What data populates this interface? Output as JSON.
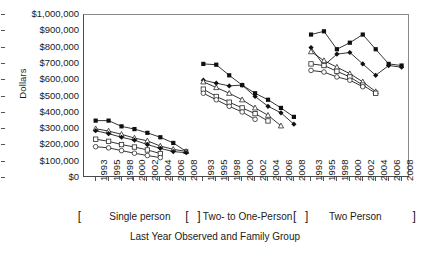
{
  "chart_data": {
    "type": "line",
    "title": "",
    "xlabel": "Last Year Observed and Family Group",
    "ylabel": "Dollars",
    "ylim": [
      0,
      1000000
    ],
    "ytick_labels": [
      "$1,000,000",
      "$900,000",
      "$800,000",
      "$700,000",
      "$600,000",
      "$500,000",
      "$400,000",
      "$300,000",
      "$200,000",
      "$100,000",
      "$0"
    ],
    "ytick_values": [
      1000000,
      900000,
      800000,
      700000,
      600000,
      500000,
      400000,
      300000,
      200000,
      100000,
      0
    ],
    "grid": false,
    "legend": "none",
    "categories": [
      "1993",
      "1995",
      "1998",
      "2000",
      "2002",
      "2004",
      "2006",
      "2008"
    ],
    "groups": [
      {
        "name": "Single person",
        "bracket_open": "[",
        "bracket_close": "]",
        "x": [
          "1993",
          "1995",
          "1998",
          "2000",
          "2002",
          "2004",
          "2006",
          "2008"
        ],
        "series": [
          {
            "name": "series-1",
            "marker": "filled-square",
            "values": [
              352000,
              352000,
              317000,
              300000,
              277000,
              250000,
              215000,
              163000
            ]
          },
          {
            "name": "series-2",
            "marker": "open-triangle",
            "values": [
              302000,
              288000,
              268000,
              245000,
              228000,
              196000,
              176000,
              163000
            ]
          },
          {
            "name": "series-3",
            "marker": "filled-diamond",
            "values": [
              290000,
              272000,
              250000,
              232000,
              205000,
              182000,
              162000,
              155000
            ]
          },
          {
            "name": "series-4",
            "marker": "open-square",
            "values": [
              238000,
              225000,
              205000,
              190000,
              172000,
              150000,
              null,
              null
            ]
          },
          {
            "name": "series-5",
            "marker": "open-circle",
            "values": [
              192000,
              185000,
              168000,
              152000,
              138000,
              125000,
              null,
              null
            ]
          }
        ]
      },
      {
        "name": "Two- to One-Person",
        "bracket_open": "[",
        "bracket_close": "]",
        "x": [
          "1993",
          "1995",
          "1998",
          "2000",
          "2002",
          "2004",
          "2006",
          "2008"
        ],
        "series": [
          {
            "name": "series-1",
            "marker": "filled-square",
            "values": [
              700000,
              695000,
              630000,
              570000,
              520000,
              480000,
              430000,
              375000
            ]
          },
          {
            "name": "series-2",
            "marker": "filled-diamond",
            "values": [
              600000,
              582000,
              565000,
              570000,
              500000,
              440000,
              400000,
              330000
            ]
          },
          {
            "name": "series-3",
            "marker": "open-triangle",
            "values": [
              590000,
              555000,
              520000,
              480000,
              430000,
              385000,
              320000,
              null
            ]
          },
          {
            "name": "series-4",
            "marker": "open-square",
            "values": [
              545000,
              500000,
              465000,
              430000,
              395000,
              350000,
              null,
              null
            ]
          },
          {
            "name": "series-5",
            "marker": "open-circle",
            "values": [
              520000,
              480000,
              440000,
              405000,
              360000,
              null,
              null,
              null
            ]
          }
        ]
      },
      {
        "name": "Two Person",
        "bracket_open": "[",
        "bracket_close": "]",
        "x": [
          "1993",
          "1995",
          "1998",
          "2000",
          "2002",
          "2004",
          "2006",
          "2008"
        ],
        "series": [
          {
            "name": "series-1",
            "marker": "filled-square",
            "values": [
              880000,
              900000,
              790000,
              830000,
              880000,
              790000,
              700000,
              690000
            ]
          },
          {
            "name": "series-2",
            "marker": "filled-diamond",
            "values": [
              800000,
              690000,
              760000,
              770000,
              700000,
              630000,
              690000,
              680000
            ]
          },
          {
            "name": "series-3",
            "marker": "open-triangle",
            "values": [
              775000,
              720000,
              680000,
              640000,
              590000,
              530000,
              null,
              null
            ]
          },
          {
            "name": "series-4",
            "marker": "open-square",
            "values": [
              700000,
              690000,
              655000,
              620000,
              570000,
              520000,
              null,
              null
            ]
          },
          {
            "name": "series-5",
            "marker": "open-circle",
            "values": [
              660000,
              650000,
              620000,
              600000,
              560000,
              null,
              null,
              null
            ]
          }
        ]
      }
    ]
  }
}
